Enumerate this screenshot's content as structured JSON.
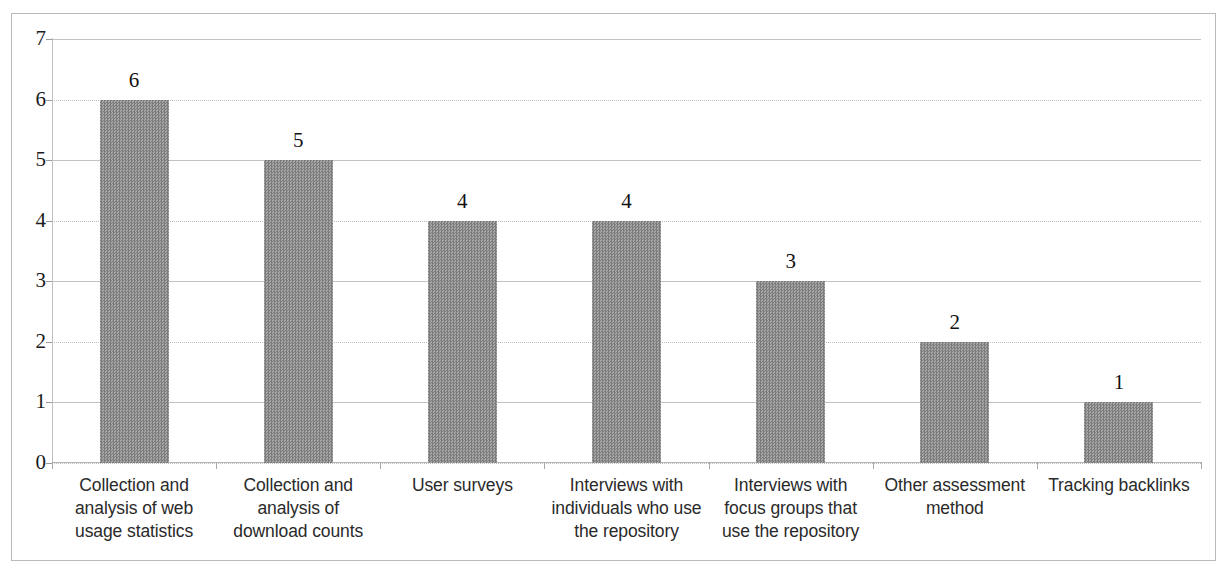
{
  "chart_data": {
    "type": "bar",
    "title": "",
    "subtitle": "",
    "xlabel": "",
    "ylabel": "",
    "ylim": [
      0,
      7
    ],
    "yticks": [
      "0",
      "1",
      "2",
      "3",
      "4",
      "5",
      "6",
      "7"
    ],
    "grid": true,
    "legend": false,
    "orientation": "vertical",
    "bar_color": "#8e8e8e",
    "categories": [
      "Collection and analysis of web usage statistics",
      "Collection and analysis of download counts",
      "User surveys",
      "Interviews with individuals who use the repository",
      "Interviews with focus groups that use the repository",
      "Other assessment method",
      "Tracking backlinks"
    ],
    "category_lines": [
      [
        "Collection and",
        "analysis of web",
        "usage statistics"
      ],
      [
        "Collection and",
        "analysis of",
        "download counts"
      ],
      [
        "User surveys"
      ],
      [
        "Interviews with",
        "individuals who use",
        "the repository"
      ],
      [
        "Interviews with",
        "focus groups that",
        "use the repository"
      ],
      [
        "Other assessment",
        "method"
      ],
      [
        "Tracking backlinks"
      ]
    ],
    "values": [
      6,
      5,
      4,
      4,
      3,
      2,
      1
    ],
    "value_labels": [
      "6",
      "5",
      "4",
      "4",
      "3",
      "2",
      "1"
    ]
  }
}
